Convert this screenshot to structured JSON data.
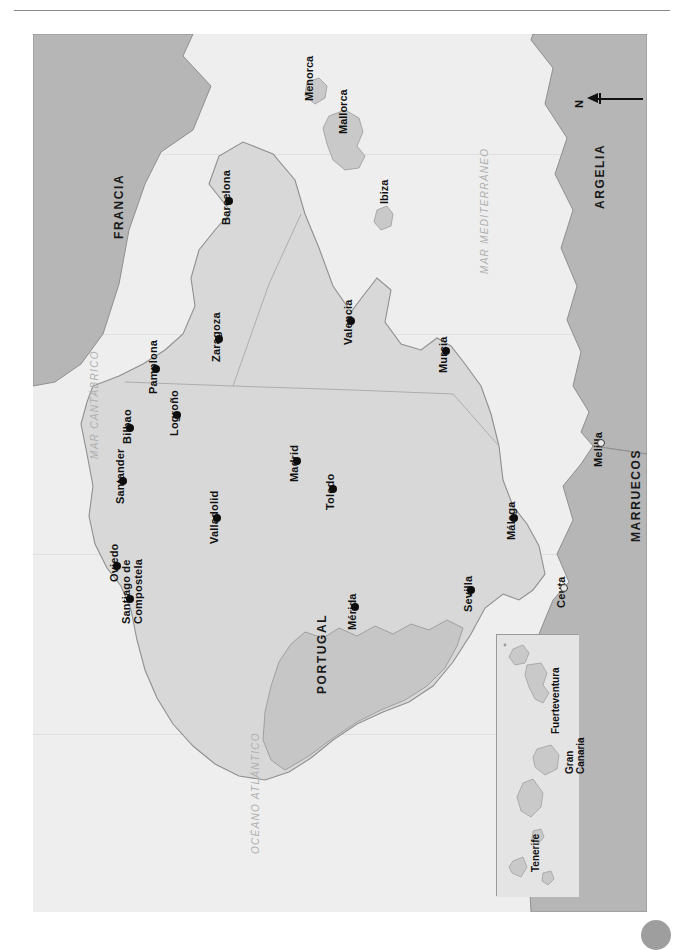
{
  "document": {
    "title": "Mapa de España",
    "has_top_rule": true
  },
  "map": {
    "projection_note": "rotated-90",
    "colors": {
      "ocean": "#eeeeee",
      "spain": "#d8d8d8",
      "portugal": "#c6c6c6",
      "foreign": "#b6b6b6",
      "islands": "#c9c9c9",
      "border": "#8f8f8f",
      "city_dot": "#0d0d0d",
      "sea_label": "#b0b0b0"
    },
    "cities": [
      {
        "name": "Santiago de Compostela",
        "multiline": [
          "Santiago de",
          "Compostela"
        ],
        "x": 97,
        "y": 565,
        "marker": "filled"
      },
      {
        "name": "Oviedo",
        "x": 84,
        "y": 532,
        "marker": "filled"
      },
      {
        "name": "Santander",
        "x": 90,
        "y": 447,
        "marker": "filled"
      },
      {
        "name": "Bilbao",
        "x": 97,
        "y": 394,
        "marker": "filled"
      },
      {
        "name": "Pamplona",
        "x": 123,
        "y": 335,
        "marker": "filled"
      },
      {
        "name": "Logroño",
        "x": 144,
        "y": 381,
        "marker": "filled"
      },
      {
        "name": "Zaragoza",
        "x": 186,
        "y": 305,
        "marker": "filled"
      },
      {
        "name": "Barcelona",
        "x": 196,
        "y": 167,
        "marker": "filled"
      },
      {
        "name": "Valladolid",
        "x": 184,
        "y": 484,
        "marker": "filled"
      },
      {
        "name": "Madrid",
        "x": 264,
        "y": 427,
        "marker": "filled"
      },
      {
        "name": "Toledo",
        "x": 300,
        "y": 455,
        "marker": "filled"
      },
      {
        "name": "Valencia",
        "x": 318,
        "y": 287,
        "marker": "filled"
      },
      {
        "name": "Murcia",
        "x": 413,
        "y": 317,
        "marker": "filled"
      },
      {
        "name": "Mérida",
        "x": 322,
        "y": 573,
        "marker": "filled"
      },
      {
        "name": "Sevilla",
        "x": 438,
        "y": 556,
        "marker": "filled"
      },
      {
        "name": "Málaga",
        "x": 481,
        "y": 484,
        "marker": "filled"
      },
      {
        "name": "Ceuta",
        "x": 531,
        "y": 554,
        "marker": "open"
      },
      {
        "name": "Melilla",
        "x": 568,
        "y": 409,
        "marker": "open"
      }
    ],
    "countries": [
      {
        "name": "FRANCIA",
        "x": 80,
        "y": 205
      },
      {
        "name": "PORTUGAL",
        "x": 283,
        "y": 660
      },
      {
        "name": "ARGELIA",
        "x": 561,
        "y": 175
      },
      {
        "name": "MARRUECOS",
        "x": 597,
        "y": 508
      }
    ],
    "islands": [
      {
        "name": "Menorca",
        "x": 271,
        "y": 67
      },
      {
        "name": "Mallorca",
        "x": 305,
        "y": 100
      },
      {
        "name": "Ibiza",
        "x": 346,
        "y": 170
      }
    ],
    "seas": [
      {
        "name": "OCÉANO ATLÁNTICO",
        "x": 218,
        "y": 820
      },
      {
        "name": "MAR CANTÁBRICO",
        "x": 57,
        "y": 425
      },
      {
        "name": "MAR MEDITERRÁNEO",
        "x": 447,
        "y": 240
      }
    ],
    "scale": {
      "min_label": "0",
      "max_label": "250 km",
      "units": "km"
    },
    "north_arrow": {
      "label": "N"
    },
    "inset": {
      "name": "Islas Canarias",
      "islands": [
        {
          "name": "Fuerteventura",
          "x": 533,
          "y": 695
        },
        {
          "name": "Gran Canaria",
          "multiline": [
            "Gran",
            "Canaria"
          ],
          "x": 586,
          "y": 735
        },
        {
          "name": "Tenerife",
          "x": 543,
          "y": 820
        }
      ]
    }
  }
}
